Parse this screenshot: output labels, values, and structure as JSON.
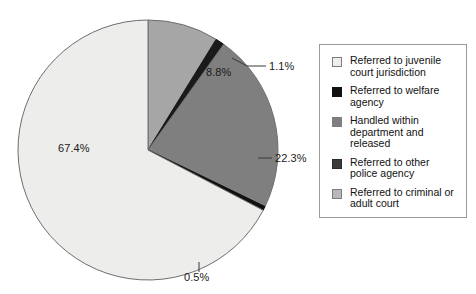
{
  "chart_data": {
    "type": "pie",
    "title": "",
    "subtitle": "",
    "xlabel": "",
    "ylabel": "",
    "legend_position": "right",
    "grid": false,
    "units": "percent",
    "start_angle_deg": 0,
    "direction": "clockwise",
    "categories": [
      "Handled within department and released",
      "Referred to other police agency",
      "Referred to criminal or adult court",
      "Referred to welfare agency",
      "Referred to juvenile court jurisdiction"
    ],
    "values": [
      8.8,
      1.1,
      22.3,
      0.5,
      67.4
    ],
    "slices": [
      {
        "label": "8.8%",
        "value": 8.8,
        "category": "Handled within department and released",
        "color": "#a6a6a6",
        "label_x": 206,
        "label_y": 72,
        "leader": false
      },
      {
        "label": "1.1%",
        "value": 1.1,
        "category": "Referred to other police agency",
        "color": "#1a1a1a",
        "label_x": 272,
        "label_y": 70,
        "leader": true
      },
      {
        "label": "22.3%",
        "value": 22.3,
        "category": "Referred to criminal or adult court",
        "color": "#7f7f7f",
        "label_x": 271,
        "label_y": 164,
        "leader": true
      },
      {
        "label": "0.5%",
        "value": 0.5,
        "category": "Referred to welfare agency",
        "color": "#111111",
        "label_x": 185,
        "label_y": 270,
        "leader": true
      },
      {
        "label": "67.4%",
        "value": 67.4,
        "category": "Referred to juvenile court jurisdiction",
        "color": "#ededeb",
        "label_x": 60,
        "label_y": 143,
        "leader": false
      }
    ]
  },
  "legend": {
    "items": [
      {
        "label": "Referred to juvenile court jurisdiction",
        "color": "#eeeeec"
      },
      {
        "label": "Referred to welfare agency",
        "color": "#111111"
      },
      {
        "label": "Handled within department and released",
        "color": "#7f7f7f"
      },
      {
        "label": "Referred to other police agency",
        "color": "#3a3a3a"
      },
      {
        "label": "Referred to criminal or adult court",
        "color": "#b8b8b8"
      }
    ]
  },
  "colors": {
    "outline": "#6e6e6e",
    "legend_border": "#9a9a9a",
    "text": "#111111",
    "background": "#ffffff"
  }
}
